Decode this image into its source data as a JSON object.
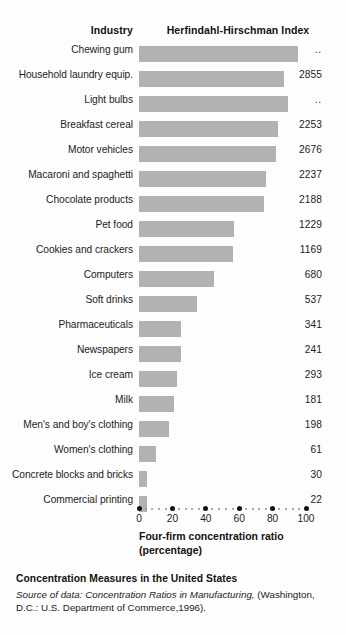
{
  "header": {
    "industry_label": "Industry",
    "index_label": "Herfindahl-Hirschman Index"
  },
  "footer": {
    "title": "Concentration Measures in the United States",
    "source_prefix": "Source of data:",
    "source_italic": "Concentration Ratios in Manufacturing,",
    "source_rest": "(Washington, D.C.: U.S. Department of Commerce,1996)."
  },
  "chart_data": {
    "type": "bar",
    "orientation": "horizontal",
    "title": "Concentration Measures in the United States",
    "xlabel": "Four-firm concentration ratio (percentage)",
    "ylabel": "Industry",
    "xlim": [
      0,
      100
    ],
    "xticks": [
      0,
      20,
      40,
      60,
      80,
      100
    ],
    "xtick_labels": [
      "0",
      "20",
      "40",
      "60",
      "80",
      "100"
    ],
    "grid": false,
    "legend": null,
    "bar_color": "#b2b2b2",
    "value_column_header": "Herfindahl-Hirschman Index",
    "categories": [
      "Chewing gum",
      "Household laundry equip.",
      "Light bulbs",
      "Breakfast cereal",
      "Motor vehicles",
      "Macaroni and spaghetti",
      "Chocolate products",
      "Pet food",
      "Cookies and crackers",
      "Computers",
      "Soft drinks",
      "Pharmaceuticals",
      "Newspapers",
      "Ice cream",
      "Milk",
      "Men's and boy's clothing",
      "Women's clothing",
      "Concrete blocks and bricks",
      "Commercial printing"
    ],
    "values": [
      95,
      87,
      89,
      83,
      82,
      76,
      75,
      57,
      56,
      45,
      35,
      25,
      25,
      23,
      21,
      18,
      10,
      5,
      5
    ],
    "hhi": [
      "..",
      "2855",
      "..",
      "2253",
      "2676",
      "2237",
      "2188",
      "1229",
      "1169",
      "680",
      "537",
      "341",
      "241",
      "293",
      "181",
      "198",
      "61",
      "30",
      "22"
    ],
    "note": ".. denotes data not available"
  }
}
